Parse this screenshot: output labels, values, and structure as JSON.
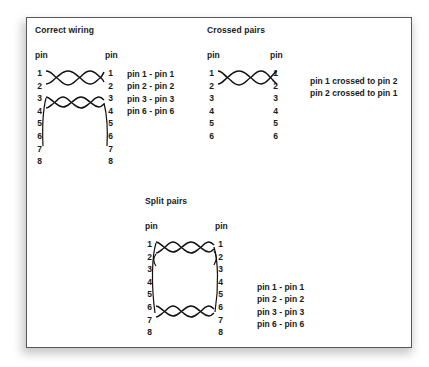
{
  "diagram": {
    "title_visible": false,
    "sections": [
      {
        "id": "correct-wiring",
        "heading": "Correct wiring",
        "left_pin_label": "pin",
        "right_pin_label": "pin",
        "left_pins": "1\n2\n3\n4\n5\n6\n7\n8",
        "right_pins": "1\n2\n3\n4\n5\n6\n7\n8",
        "notes": "pin 1 - pin 1\npin 2 - pin 2\npin 3 - pin 3\npin 6 - pin 6"
      },
      {
        "id": "crossed-pairs",
        "heading": "Crossed pairs",
        "left_pin_label": "pin",
        "right_pin_label": "pin",
        "left_pins": "1\n2\n3\n4\n5\n6",
        "right_pins": "1\n2\n3\n4\n5\n6",
        "notes": "pin 1 crossed to pin 2\npin 2 crossed to pin 1"
      },
      {
        "id": "split-pairs",
        "heading": "Split pairs",
        "left_pin_label": "pin",
        "right_pin_label": "pin",
        "left_pins": "1\n2\n3\n4\n5\n6\n7\n8",
        "right_pins": "1\n2\n3\n4\n5\n6\n7\n8",
        "notes": "pin 1 - pin 1\npin 2 - pin 2\npin 3 - pin 3\npin 6 - pin 6"
      }
    ],
    "colors": {
      "wire": "#111111",
      "text": "#1a1a1a",
      "panel_background": "#ffffff",
      "panel_border": "#585858",
      "page_background": "#ffffff"
    }
  }
}
